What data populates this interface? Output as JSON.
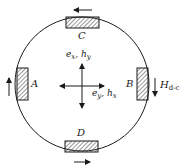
{
  "diagram": {
    "type": "waveguide-cross-section",
    "shape": "circle",
    "stroke_color": "#1a1a1a",
    "hatch_color": "#333333",
    "ports": [
      {
        "id": "A",
        "label": "A",
        "position": "left",
        "current_direction": "up"
      },
      {
        "id": "B",
        "label": "B",
        "position": "right",
        "current_direction": "down"
      },
      {
        "id": "C",
        "label": "C",
        "position": "top",
        "current_direction": "left"
      },
      {
        "id": "D",
        "label": "D",
        "position": "bottom",
        "current_direction": "right"
      }
    ],
    "center_axes": {
      "vertical_label": {
        "main": "e",
        "sub1": "x",
        "sep": ", ",
        "main2": "h",
        "sub2": "y"
      },
      "horizontal_label": {
        "main": "e",
        "sub1": "y",
        "sep": ", ",
        "main2": "h",
        "sub2": "x"
      }
    },
    "field_label": {
      "main": "H",
      "sub": "d-c"
    }
  }
}
